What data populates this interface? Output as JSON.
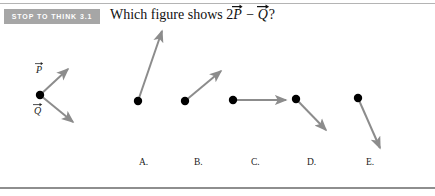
{
  "badge": {
    "text": "STOP TO THINK 3.1",
    "bg_color": "#a6a6a6",
    "text_color": "#ffffff"
  },
  "question": {
    "prefix": "Which figure shows 2",
    "vector_p": "P",
    "operator": " − ",
    "vector_q": "Q",
    "suffix": "?"
  },
  "given_vectors": {
    "caption_p": "P",
    "caption_q": "Q",
    "origin": {
      "x": 40,
      "y": 95
    },
    "vectors": [
      {
        "name": "P",
        "tip_x": 70,
        "tip_y": 67,
        "label_x": 37,
        "label_y": 72
      },
      {
        "name": "Q",
        "tip_x": 75,
        "tip_y": 124,
        "label_x": 35,
        "label_y": 112
      }
    ]
  },
  "choices": [
    {
      "label": "A.",
      "label_x": 139,
      "label_y": 163,
      "dot_x": 138,
      "dot_y": 101,
      "tip_x": 164,
      "tip_y": 27,
      "description": "long steep up-right arrow"
    },
    {
      "label": "B.",
      "label_x": 194,
      "label_y": 163,
      "dot_x": 185,
      "dot_y": 101,
      "tip_x": 223,
      "tip_y": 68,
      "description": "medium up-right arrow at forty-five degrees"
    },
    {
      "label": "C.",
      "label_x": 251,
      "label_y": 163,
      "dot_x": 233,
      "dot_y": 100,
      "tip_x": 289,
      "tip_y": 100,
      "description": "horizontal arrow pointing right"
    },
    {
      "label": "D.",
      "label_x": 307,
      "label_y": 163,
      "dot_x": 296,
      "dot_y": 99,
      "tip_x": 329,
      "tip_y": 133,
      "description": "medium down-right arrow at forty-five degrees"
    },
    {
      "label": "E.",
      "label_x": 366,
      "label_y": 163,
      "dot_x": 358,
      "dot_y": 98,
      "tip_x": 382,
      "tip_y": 152,
      "description": "long steep down-right arrow"
    }
  ],
  "style": {
    "arrow_color": "#8c8c8c",
    "dot_color": "#000000",
    "rule_color": "#9a9a9a",
    "background": "#ffffff"
  }
}
